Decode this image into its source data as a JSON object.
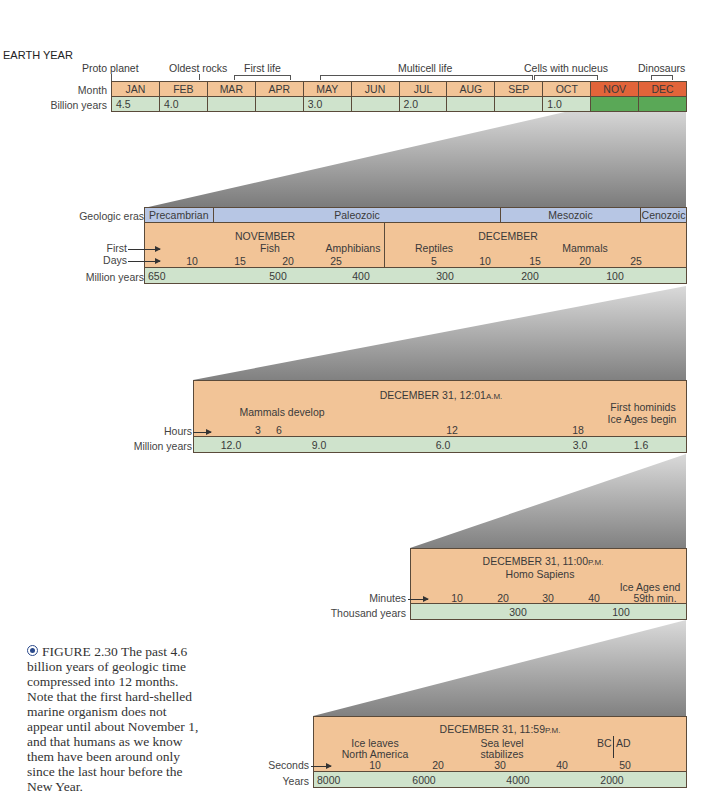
{
  "title": "EARTH YEAR",
  "earth_year": {
    "events": [
      {
        "label": "Proto planet"
      },
      {
        "label": "Oldest rocks"
      },
      {
        "label": "First life"
      },
      {
        "label": "Multicell life"
      },
      {
        "label": "Cells with nucleus"
      },
      {
        "label": "Dinosaurs"
      }
    ],
    "row_labels": {
      "month": "Month",
      "billion_years": "Billion years"
    },
    "months": [
      "JAN",
      "FEB",
      "MAR",
      "APR",
      "MAY",
      "JUN",
      "JUL",
      "AUG",
      "SEP",
      "OCT",
      "NOV",
      "DEC"
    ],
    "billion_years": [
      "4.5",
      "4.0",
      "",
      "",
      "3.0",
      "",
      "2.0",
      "",
      "",
      "1.0",
      "",
      ""
    ]
  },
  "nov_dec": {
    "row_labels": {
      "eras": "Geologic eras",
      "first": "First",
      "days": "Days",
      "million_years": "Million years"
    },
    "eras": [
      "Precambrian",
      "Paleozoic",
      "Mesozoic",
      "Cenozoic"
    ],
    "month_nov": "NOVEMBER",
    "month_dec": "DECEMBER",
    "firsts": [
      "Fish",
      "Amphibians",
      "Reptiles",
      "Mammals"
    ],
    "days": [
      "10",
      "15",
      "20",
      "25",
      "5",
      "10",
      "15",
      "20",
      "25"
    ],
    "million_years": [
      "650",
      "500",
      "400",
      "300",
      "200",
      "100"
    ]
  },
  "dec31_hours": {
    "title": "DECEMBER 31, 12:01",
    "title_suffix": "A.M.",
    "events": {
      "mammals": "Mammals develop",
      "hominids": "First hominids",
      "ice": "Ice Ages begin"
    },
    "row_labels": {
      "hours": "Hours",
      "million_years": "Million years"
    },
    "hours": [
      "3",
      "6",
      "12",
      "18"
    ],
    "million_years": [
      "12.0",
      "9.0",
      "6.0",
      "3.0",
      "1.6"
    ]
  },
  "dec31_minutes": {
    "title": "DECEMBER 31, 11:00",
    "title_suffix": "P.M.",
    "events": {
      "homo": "Homo Sapiens",
      "ice_end": "Ice Ages end"
    },
    "row_labels": {
      "minutes": "Minutes",
      "thousand_years": "Thousand years"
    },
    "minutes": [
      "10",
      "20",
      "30",
      "40",
      "59th min."
    ],
    "thousand_years": [
      "300",
      "100"
    ]
  },
  "dec31_seconds": {
    "title": "DECEMBER 31, 11:59",
    "title_suffix": "P.M.",
    "events": {
      "ice1": "Ice leaves",
      "ice2": "North America",
      "sea1": "Sea level",
      "sea2": "stabilizes",
      "bc": "BC",
      "ad": "AD"
    },
    "row_labels": {
      "seconds": "Seconds",
      "years": "Years"
    },
    "seconds": [
      "10",
      "20",
      "30",
      "40",
      "50"
    ],
    "years": [
      "8000",
      "6000",
      "4000",
      "2000"
    ]
  },
  "caption": {
    "figure": "FIGURE 2.30",
    "text": "The past 4.6 billion years of geologic time compressed into 12 months. Note that the first hard-shelled marine organism does not appear until about November 1, and that humans as we know them have been around only since the last hour before the New Year."
  },
  "colors": {
    "peach": "#f2c497",
    "green": "#cfe3cc",
    "blue": "#b7c6e4",
    "nov_dec": "#e2643a",
    "dark_green": "#5aa857"
  }
}
